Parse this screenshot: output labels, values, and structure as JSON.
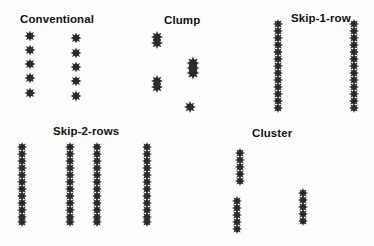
{
  "diagram": {
    "colors": {
      "background": "#fdfdfd",
      "plant": "#2b2b2b",
      "label": "#111111"
    },
    "plant_icon": "eight-point-star-icon",
    "panels": [
      {
        "id": "conventional",
        "label": "Conventional",
        "label_pos": [
          20,
          13
        ],
        "columns": [
          {
            "x": 30,
            "ys": [
              36,
              50,
              64,
              78,
              93
            ],
            "size": 5.5
          },
          {
            "x": 76,
            "ys": [
              38,
              53,
              67,
              81,
              96
            ],
            "size": 5.5
          }
        ]
      },
      {
        "id": "clump",
        "label": "Clump",
        "label_pos": [
          164,
          14
        ],
        "columns": [
          {
            "x": 157,
            "ys": [
              37,
              43
            ],
            "size": 6
          },
          {
            "x": 193,
            "ys": [
              63,
              68,
              73
            ],
            "size": 6.5
          },
          {
            "x": 157,
            "ys": [
              81,
              87
            ],
            "size": 6
          },
          {
            "x": 190,
            "ys": [
              107
            ],
            "size": 6
          }
        ]
      },
      {
        "id": "skip-1-row",
        "label": "Skip-1-row",
        "label_pos": [
          291,
          12
        ],
        "columns": [
          {
            "x": 278,
            "ys": [
              24,
              31,
              38,
              45,
              52,
              59,
              66,
              73,
              80,
              87,
              94,
              101,
              108
            ],
            "size": 5
          },
          {
            "x": 354,
            "ys": [
              24,
              31,
              38,
              45,
              52,
              59,
              66,
              73,
              80,
              87,
              94,
              101,
              108
            ],
            "size": 5
          }
        ]
      },
      {
        "id": "skip-2-rows",
        "label": "Skip-2-rows",
        "label_pos": [
          53,
          125
        ],
        "columns": [
          {
            "x": 22,
            "ys": [
              147,
              154,
              161,
              168,
              175,
              182,
              189,
              196,
              203,
              210,
              217,
              222
            ],
            "size": 5
          },
          {
            "x": 70,
            "ys": [
              147,
              154,
              161,
              168,
              175,
              182,
              189,
              196,
              203,
              210,
              217,
              222
            ],
            "size": 5
          },
          {
            "x": 97,
            "ys": [
              147,
              154,
              161,
              168,
              175,
              182,
              189,
              196,
              203,
              210,
              217,
              222
            ],
            "size": 5
          },
          {
            "x": 147,
            "ys": [
              147,
              154,
              161,
              168,
              175,
              182,
              189,
              196,
              203,
              210,
              217,
              222
            ],
            "size": 5
          }
        ]
      },
      {
        "id": "cluster",
        "label": "Cluster",
        "label_pos": [
          252,
          127
        ],
        "columns": [
          {
            "x": 240,
            "ys": [
              153,
              160,
              167,
              174,
              181
            ],
            "size": 5
          },
          {
            "x": 237,
            "ys": [
              201,
              208,
              215,
              222,
              229
            ],
            "size": 5
          },
          {
            "x": 303,
            "ys": [
              193,
              200,
              207,
              214,
              221
            ],
            "size": 5
          }
        ]
      }
    ]
  }
}
